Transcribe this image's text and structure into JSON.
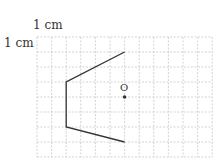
{
  "labels": {
    "top_unit": "1 cm",
    "left_unit": "1 cm",
    "point": "O"
  },
  "grid": {
    "columns": 12,
    "rows": 8,
    "cell_cm": 1,
    "line_color": "#c8c8c8"
  },
  "figure": {
    "type": "open polyline",
    "vertices_grid": [
      [
        6,
        1
      ],
      [
        2,
        3
      ],
      [
        2,
        6
      ],
      [
        6,
        7
      ]
    ],
    "stroke": "#333333"
  },
  "point_O": {
    "grid": [
      6,
      4
    ],
    "color": "#333333"
  }
}
